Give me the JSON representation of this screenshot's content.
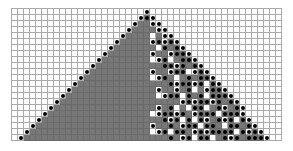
{
  "diagram": {
    "type": "cellular-automaton-grid",
    "cols": 45,
    "rows": 22,
    "cell_px": 6,
    "colors": {
      "grid_line": "#aaaaaa",
      "filled": "#777777",
      "empty": "#ffffff",
      "dot": "#000000"
    },
    "legend": "rows: . empty, g gray, G gray+dot, o white+dot, w white-in-triangle",
    "pattern": [
      "......................o......................",
      ".....................oGo.....................",
      "....................oggoo....................",
      "...................oggggoo...................",
      "..................oggggwgoo..................",
      ".................ogggggoGoGo.................",
      "................ogggggggwGgGo................",
      "...............ogggggggoggoGGo...............",
      "..............oggggggggwoGwgGGo..............",
      ".............ogggggggggggGGoGgGo.............",
      "............oggggggggggoggoGGwoGo............",
      "...........ogggggggggggwoGgwgGgGGo...........",
      "..........ogggggggggggggggGoGGoGwGo..........",
      ".........oggggggggggggggoggogGwgoGGo.........",
      "........ogggggggggggggggwoGGwGgGwGGGo........",
      ".......oggggggggggggggggggggoGoGGoGgGo.......",
      "......ogggggggggggggggggogGwgwGGwgGogGo......",
      ".....ogggggggggggggggggwoGGoGgoGGGwGGGo.....",
      "....oggggggggggggggggggggGoGwGwGogGoGwGo....",
      "...ogggggggggggggggggggoggGgoGGwGGgwGGgGo...",
      "..oggggggggggggggggggggwoGwGGgoGoGGGGwGoGo..",
      ".oggggggggggggggggggggggggGgoGwGGwgGoGgGGGo."
    ]
  }
}
